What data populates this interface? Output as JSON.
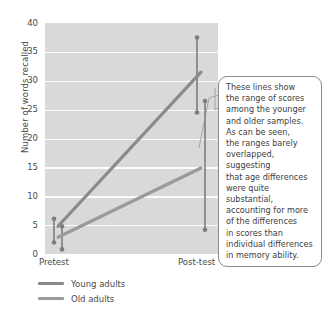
{
  "chart_data": {
    "type": "line",
    "title": "",
    "xlabel": "",
    "ylabel": "Number of words recalled",
    "categories": [
      "Pretest",
      "Post-test"
    ],
    "ylim": [
      0,
      40
    ],
    "ytick_labels": [
      "0",
      "5",
      "10",
      "15",
      "20",
      "25",
      "30",
      "35",
      "40"
    ],
    "ytick_values": [
      0,
      5,
      10,
      15,
      20,
      25,
      30,
      35,
      40
    ],
    "grid": true,
    "legend_position": "below-axis-left",
    "series": [
      {
        "name": "Young adults",
        "color": "#8a8a8a",
        "values": [
          4.8,
          31.5
        ],
        "range_low": [
          2.0,
          24.5
        ],
        "range_high": [
          6.1,
          37.5
        ]
      },
      {
        "name": "Old adults",
        "color": "#9a9a9a",
        "values": [
          2.9,
          14.9
        ],
        "range_low": [
          0.8,
          4.2
        ],
        "range_high": [
          4.8,
          26.5
        ]
      }
    ],
    "annotations": [
      {
        "name": "range-explanation",
        "text": "These lines show\nthe range of scores\namong the younger\nand older samples.\nAs can be seen,\nthe ranges barely\noverlapped, suggesting\nthat age differences\nwere quite substantial,\naccounting for more\nof the differences\nin scores than\nindividual differences\nin memory ability."
      }
    ],
    "colors": {
      "plot_background": "#d9d9d9",
      "gridline": "#fbfbfb",
      "marker": "#7d7d7d",
      "callout_border": "#8c8c8c",
      "text": "#4a4a4a"
    }
  },
  "axes": {
    "y_title": "Number of words recalled",
    "y_ticks": [
      "40",
      "35",
      "30",
      "25",
      "20",
      "15",
      "10",
      "5",
      "0"
    ],
    "x_ticks": [
      "Pretest",
      "Post-test"
    ]
  },
  "legend": {
    "items": [
      {
        "label": "Young adults"
      },
      {
        "label": "Old adults"
      }
    ]
  },
  "callout": {
    "text": "These lines show\nthe range of scores\namong the younger\nand older samples.\nAs can be seen,\nthe ranges barely\noverlapped, suggesting\nthat age differences\nwere quite substantial,\naccounting for more\nof the differences\nin scores than\nindividual differences\nin memory ability."
  }
}
